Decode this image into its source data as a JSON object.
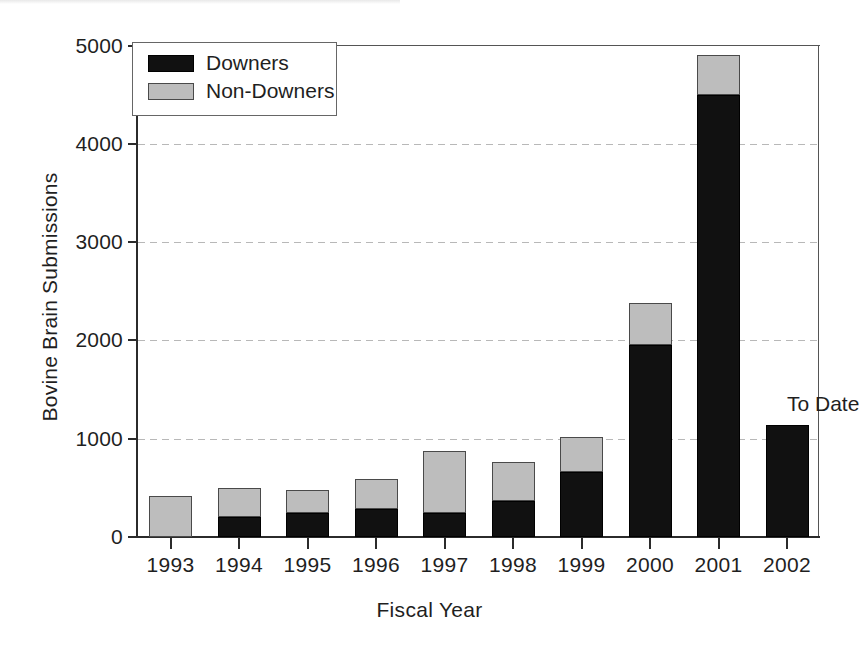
{
  "chart_data": {
    "type": "bar",
    "title": "",
    "xlabel": "Fiscal Year",
    "ylabel": "Bovine Brain Submissions",
    "stacked": true,
    "grid": true,
    "legend_position": "top-left",
    "ylim": [
      0,
      5000
    ],
    "ytick_labels": [
      "0",
      "1000",
      "2000",
      "3000",
      "4000",
      "5000"
    ],
    "ytick_values": [
      0,
      1000,
      2000,
      3000,
      4000,
      5000
    ],
    "categories": [
      "1993",
      "1994",
      "1995",
      "1996",
      "1997",
      "1998",
      "1999",
      "2000",
      "2001",
      "2002"
    ],
    "series": [
      {
        "name": "Downers",
        "color": "#111111",
        "values": [
          0,
          205,
          240,
          280,
          240,
          370,
          660,
          1950,
          4500,
          1140
        ]
      },
      {
        "name": "Non-Downers",
        "color": "#bdbdbd",
        "values": [
          415,
          295,
          240,
          315,
          635,
          395,
          360,
          430,
          400,
          0
        ]
      }
    ],
    "totals": [
      415,
      500,
      480,
      595,
      875,
      765,
      1020,
      2380,
      4900,
      1140
    ],
    "annotations": [
      {
        "text": "To Date",
        "category": "2002"
      }
    ]
  },
  "legend": {
    "items": [
      {
        "label": "Downers",
        "swatch": "swatch-downers"
      },
      {
        "label": "Non-Downers",
        "swatch": "swatch-non-downers"
      }
    ]
  },
  "axes": {
    "y_title": "Bovine Brain Submissions",
    "x_title": "Fiscal Year"
  }
}
